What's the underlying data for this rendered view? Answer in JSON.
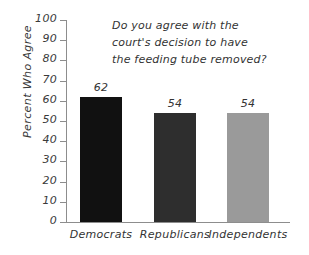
{
  "chart_data": {
    "type": "bar",
    "title": "",
    "annotation": "Do you agree with the court's decision to have the feeding tube removed?",
    "annotation_lines": [
      "Do you agree with the",
      "court's decision to have",
      "the feeding tube removed?"
    ],
    "categories": [
      "Democrats",
      "Republicans",
      "Independents"
    ],
    "values": [
      62,
      54,
      54
    ],
    "value_labels": [
      "62",
      "54",
      "54"
    ],
    "bar_colors": [
      "#111111",
      "#2e2e2e",
      "#9a9a9a"
    ],
    "xlabel": "",
    "ylabel": "Percent Who Agree",
    "ylim": [
      0,
      100
    ],
    "ytick_step": 10,
    "ytick_labels": [
      "100",
      "90",
      "80",
      "70",
      "60",
      "50",
      "40",
      "30",
      "20",
      "10",
      "0"
    ],
    "grid": false,
    "legend": false,
    "axis_color": "#8d8d8d",
    "text_color": "#333333",
    "background": "#ffffff"
  }
}
